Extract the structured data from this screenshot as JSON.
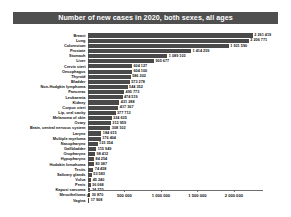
{
  "chart_data": {
    "type": "bar",
    "orientation": "horizontal",
    "title": "Number of new cases in 2020, both sexes, all ages",
    "xlabel": "",
    "ylabel": "",
    "xlim": [
      0,
      2400000
    ],
    "grid": false,
    "legend": null,
    "bar_color": "#4a4a4a",
    "title_bg_color": "#4f4f4f",
    "title_text_color": "#ffffff",
    "xticks": [
      0,
      500000,
      1000000,
      1500000,
      2000000
    ],
    "xtick_labels": [
      "0",
      "500 000",
      "1 000 000",
      "1 500 000",
      "2 000 000"
    ],
    "categories": [
      "Breast",
      "Lung",
      "Colorectum",
      "Prostate",
      "Stomach",
      "Liver",
      "Cervix uteri",
      "Oesophagus",
      "Thyroid",
      "Bladder",
      "Non-Hodgkin lymphoma",
      "Pancreas",
      "Leukaemia",
      "Kidney",
      "Corpus uteri",
      "Lip, oral cavity",
      "Melanoma of skin",
      "Ovary",
      "Brain, central nervous system",
      "Larynx",
      "Multiple myeloma",
      "Nasopharynx",
      "Gallbladder",
      "Oropharynx",
      "Hypopharynx",
      "Hodgkin lymphoma",
      "Testis",
      "Salivary glands",
      "Vulva",
      "Penis",
      "Kaposi sarcoma",
      "Mesothelioma",
      "Vagina"
    ],
    "values": [
      2261419,
      2206771,
      1931590,
      1414259,
      1089103,
      905677,
      604127,
      604100,
      586202,
      573278,
      544352,
      495773,
      474519,
      431288,
      417367,
      377713,
      324635,
      313959,
      308102,
      184615,
      176404,
      133354,
      115949,
      98412,
      84254,
      83087,
      74458,
      53583,
      45240,
      36068,
      34270,
      30870,
      17908
    ],
    "value_labels": [
      "2 261 419",
      "2 206 771",
      "1 931 590",
      "1 414 259",
      "1 089 103",
      "905 677",
      "604 127",
      "604 100",
      "586 202",
      "573 278",
      "544 352",
      "495 773",
      "474 519",
      "431 288",
      "417 367",
      "377 713",
      "324 635",
      "313 959",
      "308 102",
      "184 615",
      "176 404",
      "133 354",
      "115 949",
      "98 412",
      "84 254",
      "83 087",
      "74 458",
      "53 583",
      "45 240",
      "36 068",
      "34 270",
      "30 870",
      "17 908"
    ]
  }
}
